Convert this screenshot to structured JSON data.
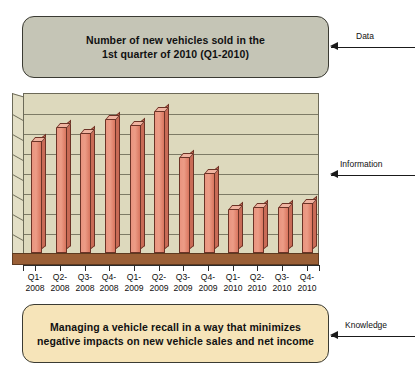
{
  "diagram": {
    "title_visible": false,
    "data_box": {
      "label_line1": "Number of new vehicles sold in the",
      "label_line2": "1st quarter of 2010 (Q1-2010)",
      "color": "#c5c5b6"
    },
    "knowledge_box": {
      "label_line1": "Managing a vehicle recall in a way that minimizes",
      "label_line2": "negative impacts on new vehicle sales and net income",
      "color": "#f6e4b9"
    },
    "annotations": [
      {
        "label": "Data",
        "icon": "left-arrow-icon"
      },
      {
        "label": "Information",
        "icon": "left-arrow-icon"
      },
      {
        "label": "Knowledge",
        "icon": "left-arrow-icon"
      }
    ]
  },
  "chart_data": {
    "type": "bar",
    "title": "",
    "xlabel": "",
    "ylabel": "",
    "grid": true,
    "legend": false,
    "ylim": [
      0,
      8
    ],
    "gridlines": 7,
    "bar_color": "#e9947f",
    "plot_background": "#ddd9bd",
    "floor_color": "#9a5f36",
    "categories": [
      "Q1-2008",
      "Q2-2008",
      "Q3-2008",
      "Q4-2008",
      "Q1-2009",
      "Q2-2009",
      "Q3-2009",
      "Q4-2009",
      "Q1-2010",
      "Q2-2010",
      "Q3-2010",
      "Q4-2010"
    ],
    "category_lines": [
      [
        "Q1-",
        "2008"
      ],
      [
        "Q2-",
        "2008"
      ],
      [
        "Q3-",
        "2008"
      ],
      [
        "Q4-",
        "2008"
      ],
      [
        "Q1-",
        "2009"
      ],
      [
        "Q2-",
        "2009"
      ],
      [
        "Q3-",
        "2009"
      ],
      [
        "Q4-",
        "2009"
      ],
      [
        "Q1-",
        "2010"
      ],
      [
        "Q2-",
        "2010"
      ],
      [
        "Q3-",
        "2010"
      ],
      [
        "Q4-",
        "2010"
      ]
    ],
    "values": [
      5.6,
      6.3,
      6.0,
      6.7,
      6.4,
      7.1,
      4.8,
      4.0,
      2.2,
      2.3,
      2.3,
      2.5
    ]
  }
}
